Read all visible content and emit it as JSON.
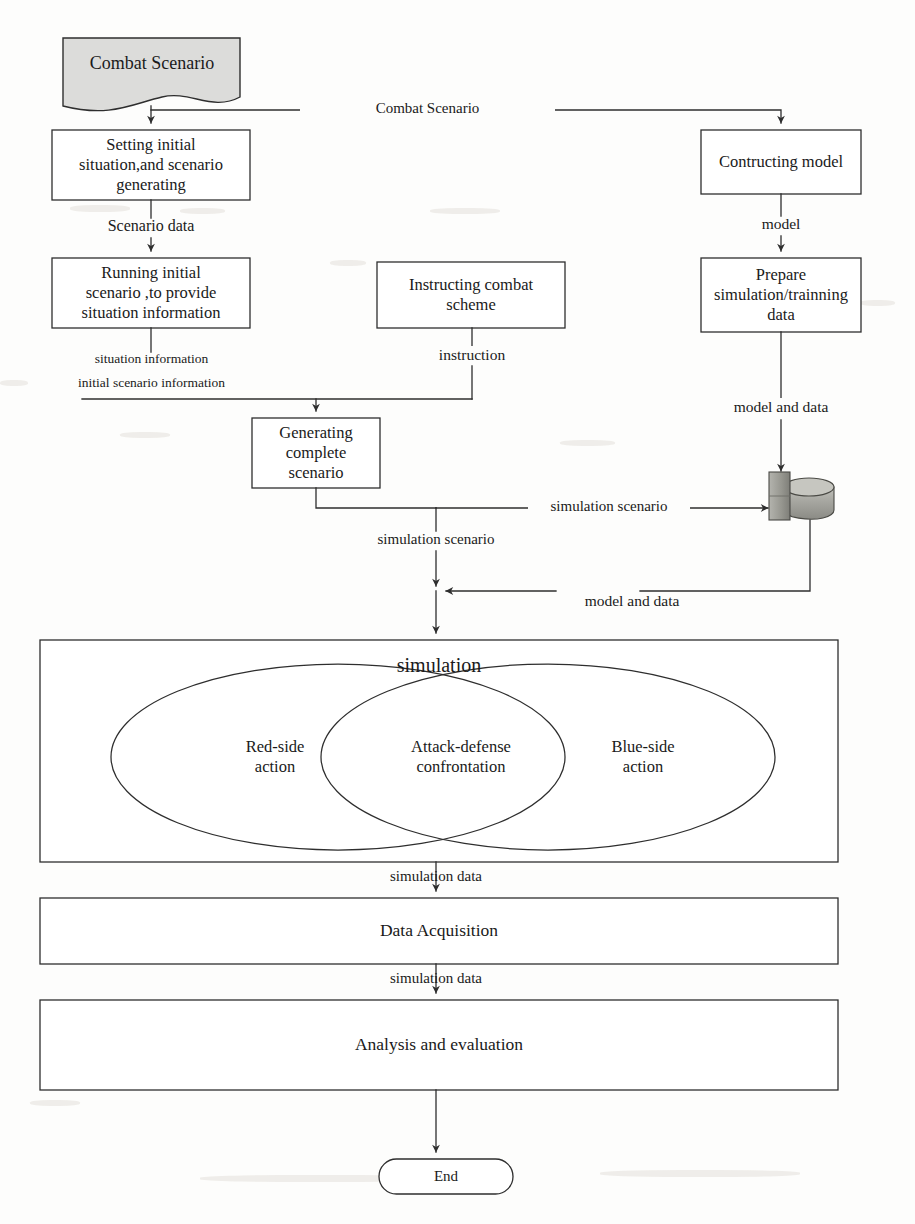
{
  "diagram": {
    "colors": {
      "stroke": "#2e2e2e",
      "text": "#161616",
      "doc_fill": "#dcdcda",
      "db_fill": "#a9a9a4",
      "db_shade": "#8e8e89",
      "page": "#fdfdfc"
    }
  },
  "nodes": {
    "combat_scenario_doc": {
      "label": "Combat Scenario",
      "shape": "document"
    },
    "setting_initial": {
      "label": "Setting initial\nsituation,and scenario\ngenerating",
      "shape": "process"
    },
    "running_initial": {
      "label": "Running initial\nscenario ,to provide\nsituation information",
      "shape": "process"
    },
    "instructing_scheme": {
      "label": "Instructing combat\nscheme",
      "shape": "process"
    },
    "generating_complete": {
      "label": "Generating\ncomplete\nscenario",
      "shape": "process"
    },
    "contructing_model": {
      "label": "Contructing model",
      "shape": "process"
    },
    "prepare_data": {
      "label": "Prepare\nsimulation/trainning\ndata",
      "shape": "process"
    },
    "database": {
      "label": "",
      "shape": "database"
    },
    "simulation": {
      "label": "simulation",
      "shape": "container"
    },
    "red_side": {
      "label": "Red-side\naction",
      "shape": "ellipse-region"
    },
    "attack_defense": {
      "label": "Attack-defense\nconfrontation",
      "shape": "ellipse-intersection"
    },
    "blue_side": {
      "label": "Blue-side\naction",
      "shape": "ellipse-region"
    },
    "data_acquisition": {
      "label": "Data Acquisition",
      "shape": "process"
    },
    "analysis_evaluation": {
      "label": "Analysis and evaluation",
      "shape": "process"
    },
    "end": {
      "label": "End",
      "shape": "terminator"
    }
  },
  "edges": {
    "combat_scenario_right": "Combat Scenario",
    "scenario_data": "Scenario data",
    "situation_information": "situation information",
    "initial_scenario_information": "initial scenario information",
    "instruction": "instruction",
    "model": "model",
    "model_and_data_down": "model and data",
    "simulation_scenario_right": "simulation scenario",
    "simulation_scenario_down": "simulation scenario",
    "model_and_data_return": "model and data",
    "simulation_data_1": "simulation data",
    "simulation_data_2": "simulation data"
  }
}
